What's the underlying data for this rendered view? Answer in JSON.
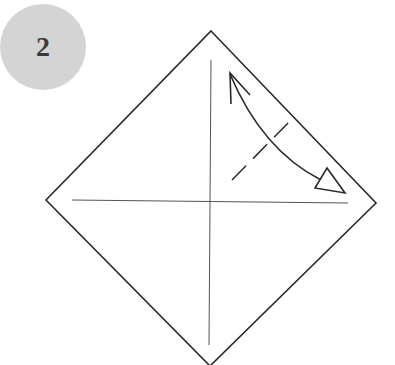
{
  "step": {
    "number": "2"
  },
  "diagram": {
    "type": "origami-fold-step",
    "paper": {
      "shape": "diamond",
      "vertices": [
        [
          211,
          31
        ],
        [
          376,
          203
        ],
        [
          210,
          366
        ],
        [
          46,
          200
        ]
      ],
      "stroke": "#2a2a2a"
    },
    "creases": [
      {
        "name": "vertical-crease",
        "from": [
          211,
          60
        ],
        "to": [
          209,
          345
        ]
      },
      {
        "name": "horizontal-crease",
        "from": [
          72,
          200
        ],
        "to": [
          348,
          203
        ]
      }
    ],
    "valley_fold_line": {
      "from": [
        232,
        180
      ],
      "to": [
        291,
        120
      ],
      "style": "dashed"
    },
    "fold_arrow": {
      "from": [
        230,
        73
      ],
      "to": [
        322,
        180
      ],
      "tail": "open-arrowhead",
      "head": "hollow-triangle"
    },
    "colors": {
      "line": "#2a2a2a",
      "badge": "#d4d4d4",
      "badge_text": "#3a3a3a"
    }
  }
}
